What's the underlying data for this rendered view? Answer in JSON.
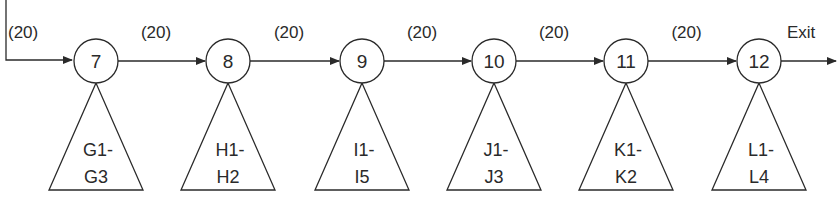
{
  "diagram": {
    "entry_weight": "(20)",
    "exit_label": "Exit",
    "nodes": [
      {
        "id": "7",
        "cx": 96,
        "subtree": [
          "G1-",
          "G3"
        ]
      },
      {
        "id": "8",
        "cx": 228,
        "subtree": [
          "H1-",
          "H2"
        ]
      },
      {
        "id": "9",
        "cx": 362,
        "subtree": [
          "I1-",
          "I5"
        ]
      },
      {
        "id": "10",
        "cx": 494,
        "subtree": [
          "J1-",
          "J3"
        ]
      },
      {
        "id": "11",
        "cx": 626,
        "subtree": [
          "K1-",
          "K2"
        ]
      },
      {
        "id": "12",
        "cx": 759,
        "subtree": [
          "L1-",
          "L4"
        ]
      }
    ],
    "edge_weights": [
      "(20)",
      "(20)",
      "(20)",
      "(20)",
      "(20)"
    ],
    "colors": {
      "stroke": "#2a2a2a",
      "background": "#ffffff"
    }
  }
}
